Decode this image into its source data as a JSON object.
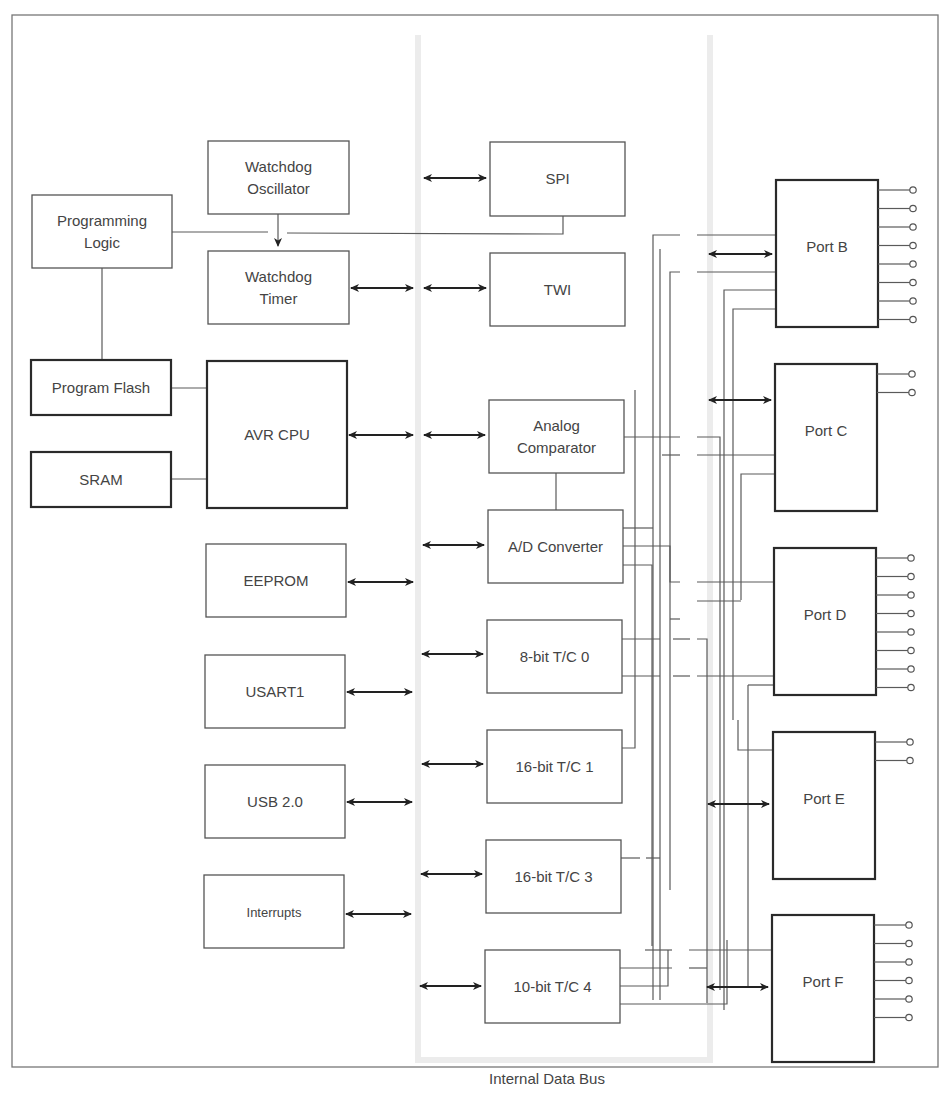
{
  "diagram": {
    "bus_label": "Internal Data Bus",
    "colors": {
      "block_stroke": "#555555",
      "bold_stroke": "#2a2a2a",
      "arrow": "#222222",
      "text": "#444444",
      "bus_shade": "#ececec"
    },
    "blocks": [
      {
        "id": "watchdog-oscillator",
        "lines": [
          "Watchdog",
          "Oscillator"
        ],
        "x": 208,
        "y": 141,
        "w": 141,
        "h": 73,
        "bold": false
      },
      {
        "id": "programming-logic",
        "lines": [
          "Programming",
          "Logic"
        ],
        "x": 32,
        "y": 195,
        "w": 140,
        "h": 73,
        "bold": false
      },
      {
        "id": "watchdog-timer",
        "lines": [
          "Watchdog",
          "Timer"
        ],
        "x": 208,
        "y": 251,
        "w": 141,
        "h": 73,
        "bold": false
      },
      {
        "id": "spi",
        "lines": [
          "SPI"
        ],
        "x": 490,
        "y": 142,
        "w": 135,
        "h": 74,
        "bold": false
      },
      {
        "id": "twi",
        "lines": [
          "TWI"
        ],
        "x": 490,
        "y": 253,
        "w": 135,
        "h": 73,
        "bold": false
      },
      {
        "id": "program-flash",
        "lines": [
          "Program Flash"
        ],
        "x": 31,
        "y": 360,
        "w": 140,
        "h": 55,
        "bold": true
      },
      {
        "id": "sram",
        "lines": [
          "SRAM"
        ],
        "x": 31,
        "y": 452,
        "w": 140,
        "h": 55,
        "bold": true
      },
      {
        "id": "avr-cpu",
        "lines": [
          "AVR CPU"
        ],
        "x": 207,
        "y": 361,
        "w": 140,
        "h": 147,
        "bold": true
      },
      {
        "id": "analog-comparator",
        "lines": [
          "Analog",
          "Comparator"
        ],
        "x": 489,
        "y": 400,
        "w": 135,
        "h": 73,
        "bold": false
      },
      {
        "id": "ad-converter",
        "lines": [
          "A/D Converter"
        ],
        "x": 488,
        "y": 510,
        "w": 135,
        "h": 73,
        "bold": false
      },
      {
        "id": "eeprom",
        "lines": [
          "EEPROM"
        ],
        "x": 206,
        "y": 544,
        "w": 140,
        "h": 73,
        "bold": false
      },
      {
        "id": "tc0",
        "lines": [
          "8-bit T/C 0"
        ],
        "x": 487,
        "y": 620,
        "w": 135,
        "h": 73,
        "bold": false
      },
      {
        "id": "usart1",
        "lines": [
          "USART1"
        ],
        "x": 205,
        "y": 655,
        "w": 140,
        "h": 73,
        "bold": false
      },
      {
        "id": "tc1",
        "lines": [
          "16-bit T/C 1"
        ],
        "x": 487,
        "y": 730,
        "w": 135,
        "h": 73,
        "bold": false
      },
      {
        "id": "usb",
        "lines": [
          "USB 2.0"
        ],
        "x": 205,
        "y": 765,
        "w": 140,
        "h": 73,
        "bold": false
      },
      {
        "id": "tc3",
        "lines": [
          "16-bit T/C 3"
        ],
        "x": 486,
        "y": 840,
        "w": 135,
        "h": 73,
        "bold": false
      },
      {
        "id": "interrupts",
        "lines": [
          "Interrupts"
        ],
        "x": 204,
        "y": 875,
        "w": 140,
        "h": 73,
        "bold": false,
        "small": true
      },
      {
        "id": "tc4",
        "lines": [
          "10-bit T/C 4"
        ],
        "x": 485,
        "y": 950,
        "w": 135,
        "h": 73,
        "bold": false
      }
    ],
    "ports": [
      {
        "id": "port-b",
        "label": "Port B",
        "x": 776,
        "y": 180,
        "w": 102,
        "h": 147,
        "pins": 8
      },
      {
        "id": "port-c",
        "label": "Port C",
        "x": 775,
        "y": 364,
        "w": 102,
        "h": 147,
        "pins": 2
      },
      {
        "id": "port-d",
        "label": "Port D",
        "x": 774,
        "y": 548,
        "w": 102,
        "h": 147,
        "pins": 8
      },
      {
        "id": "port-e",
        "label": "Port E",
        "x": 773,
        "y": 732,
        "w": 102,
        "h": 147,
        "pins": 2
      },
      {
        "id": "port-f",
        "label": "Port F",
        "x": 772,
        "y": 915,
        "w": 102,
        "h": 147,
        "pins": 6
      }
    ]
  }
}
